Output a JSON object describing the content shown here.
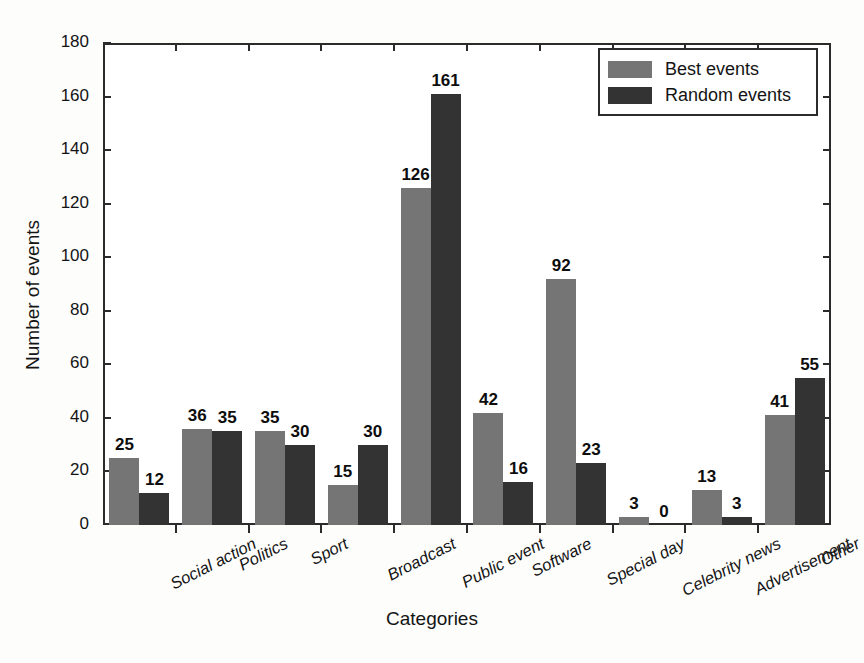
{
  "chart_data": {
    "type": "bar",
    "title": "",
    "xlabel": "Categories",
    "ylabel": "Number of events",
    "ylim": [
      0,
      180
    ],
    "ytick_step": 20,
    "yticks": [
      0,
      20,
      40,
      60,
      80,
      100,
      120,
      140,
      160,
      180
    ],
    "grid": false,
    "legend_position": "top-right",
    "categories": [
      "Social action",
      "Politics",
      "Sport",
      "Broadcast",
      "Public event",
      "Software",
      "Special day",
      "Celebrity news",
      "Advertisement",
      "Other"
    ],
    "series": [
      {
        "name": "Best events",
        "color": "#757575",
        "values": [
          25,
          36,
          35,
          15,
          126,
          42,
          92,
          3,
          13,
          41
        ]
      },
      {
        "name": "Random events",
        "color": "#333333",
        "values": [
          12,
          35,
          30,
          30,
          161,
          16,
          23,
          0,
          3,
          55
        ]
      }
    ]
  },
  "legend": {
    "entries": [
      {
        "label": "Best events"
      },
      {
        "label": "Random events"
      }
    ]
  }
}
